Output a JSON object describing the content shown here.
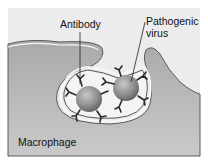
{
  "diagram": {
    "type": "phagocytosis-illustration",
    "labels": {
      "antibody": "Antibody",
      "pathogenic_virus_line1": "Pathogenic",
      "pathogenic_virus_line2": "virus",
      "macrophage": "Macrophage"
    },
    "colors": {
      "background": "#e9e9e9",
      "cell_fill": "#b9b9b9",
      "membrane": "#555555",
      "vesicle_fill": "#f3f3f3",
      "virus": "#8a8a8a",
      "antibody": "#2a2a2a"
    }
  }
}
